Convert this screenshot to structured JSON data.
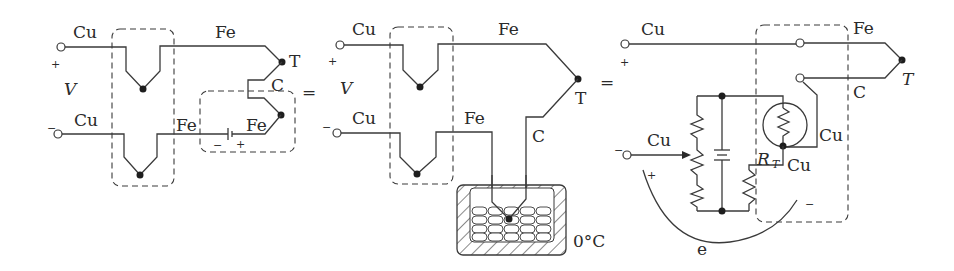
{
  "figure": {
    "equals_sign": "="
  },
  "panel1": {
    "top_wire_left": "Cu",
    "top_wire_right": "Fe",
    "bottom_wire_left": "Cu",
    "bottom_wire_mid": "Fe",
    "bottom_wire_right": "Fe",
    "junction_label": "T",
    "thermocouple_wire": "C",
    "voltage_label": "V",
    "plus": "+",
    "minus": "−",
    "battery_minus": "−",
    "battery_plus": "+"
  },
  "panel2": {
    "top_wire_left": "Cu",
    "top_wire_right": "Fe",
    "bottom_wire_left": "Cu",
    "bottom_wire_right": "Fe",
    "junction_label": "T",
    "thermocouple_wire": "C",
    "voltage_label": "V",
    "plus": "+",
    "minus": "−",
    "ice_bath_label": "0°C"
  },
  "panel3": {
    "top_wire_left": "Cu",
    "top_wire_right": "Fe",
    "bottom_wire_right": "C",
    "junction_label": "T",
    "input_wire": "Cu",
    "rt_label": "R",
    "rt_sub": "T",
    "cu_right": "Cu",
    "cu_below": "Cu",
    "emf_label": "e",
    "plus_top": "+",
    "plus_arc": "+",
    "minus_left": "−",
    "minus_arc": "−"
  }
}
